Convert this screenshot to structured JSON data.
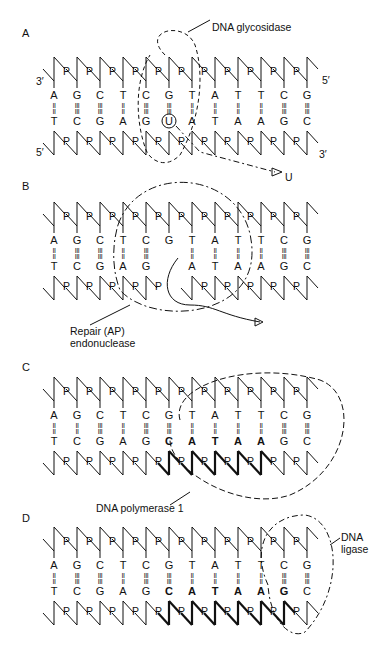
{
  "figure": {
    "header_text": "",
    "columns_x": [
      54,
      77,
      100,
      123,
      146,
      169,
      192,
      215,
      238,
      261,
      284,
      307
    ],
    "phosphate_label": "P",
    "panels": [
      {
        "id": "A",
        "label": "A",
        "y0": 55,
        "top_strand": [
          "A",
          "G",
          "C",
          "T",
          "C",
          "G",
          "T",
          "A",
          "T",
          "T",
          "C",
          "G"
        ],
        "bottom_strand": [
          "T",
          "C",
          "G",
          "A",
          "G",
          "U",
          "A",
          "T",
          "A",
          "A",
          "G",
          "C"
        ],
        "bonds": [
          "=",
          "≡",
          "≡",
          "=",
          "≡",
          "≡",
          "=",
          "=",
          "=",
          "=",
          "≡",
          "≡"
        ],
        "top_end_left": "3′",
        "top_end_right": "5′",
        "bottom_end_left": "5′",
        "bottom_end_right": "3′",
        "enzyme": "DNA glycosidase",
        "released": "U",
        "circled_base_index": 5
      },
      {
        "id": "B",
        "label": "B",
        "y0": 200,
        "top_strand": [
          "A",
          "G",
          "C",
          "T",
          "C",
          "G",
          "T",
          "A",
          "T",
          "T",
          "C",
          "G"
        ],
        "bottom_strand": [
          "T",
          "C",
          "G",
          "A",
          "G",
          "",
          "A",
          "T",
          "A",
          "A",
          "G",
          "C"
        ],
        "bonds": [
          "=",
          "≡",
          "≡",
          "=",
          "≡",
          "",
          "=",
          "=",
          "=",
          "=",
          "≡",
          "≡"
        ],
        "enzyme_line1": "Repair (AP)",
        "enzyme_line2": "endonuclease",
        "oh_label": "OH",
        "gap_index": 5
      },
      {
        "id": "C",
        "label": "C",
        "y0": 375,
        "top_strand": [
          "A",
          "G",
          "C",
          "T",
          "C",
          "G",
          "T",
          "A",
          "T",
          "T",
          "C",
          "G"
        ],
        "bottom_strand": [
          "T",
          "C",
          "G",
          "A",
          "G",
          "C",
          "A",
          "T",
          "A",
          "A",
          "G",
          "C"
        ],
        "bonds": [
          "=",
          "=",
          "≡",
          "=",
          "≡",
          "≡",
          "=",
          "=",
          "=",
          "=",
          "≡",
          "≡"
        ],
        "bold_from": 5,
        "bold_to": 9,
        "enzyme": "DNA polymerase 1",
        "oh_label": "OH"
      },
      {
        "id": "D",
        "label": "D",
        "y0": 525,
        "top_strand": [
          "A",
          "G",
          "C",
          "T",
          "C",
          "G",
          "T",
          "A",
          "T",
          "T",
          "C",
          "G"
        ],
        "bottom_strand": [
          "T",
          "C",
          "G",
          "A",
          "G",
          "C",
          "A",
          "T",
          "A",
          "A",
          "G",
          "C"
        ],
        "bonds": [
          "=",
          "≡",
          "≡",
          "=",
          "≡",
          "≡",
          "=",
          "=",
          "=",
          "=",
          "≡",
          "≡"
        ],
        "bold_from": 5,
        "bold_to": 10,
        "enzyme_line1": "DNA",
        "enzyme_line2": "ligase"
      }
    ]
  }
}
